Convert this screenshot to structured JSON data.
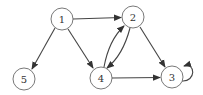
{
  "diagram": {
    "type": "directed-graph",
    "nodes": [
      {
        "id": "1",
        "label": "1",
        "x": 62,
        "y": 19
      },
      {
        "id": "2",
        "label": "2",
        "x": 133,
        "y": 17
      },
      {
        "id": "3",
        "label": "3",
        "x": 172,
        "y": 77
      },
      {
        "id": "4",
        "label": "4",
        "x": 101,
        "y": 78
      },
      {
        "id": "5",
        "label": "5",
        "x": 24,
        "y": 79
      }
    ],
    "edges": [
      {
        "from": "1",
        "to": "2"
      },
      {
        "from": "1",
        "to": "5"
      },
      {
        "from": "1",
        "to": "4"
      },
      {
        "from": "2",
        "to": "4"
      },
      {
        "from": "4",
        "to": "2"
      },
      {
        "from": "2",
        "to": "3"
      },
      {
        "from": "4",
        "to": "3"
      },
      {
        "from": "3",
        "to": "3"
      }
    ]
  }
}
